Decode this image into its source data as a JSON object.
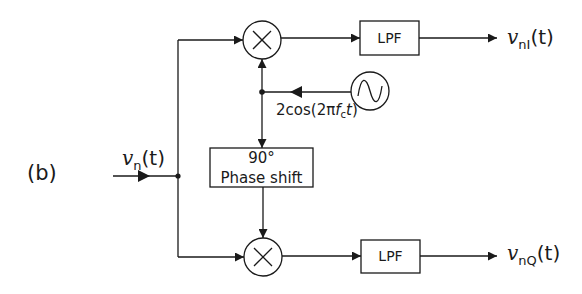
{
  "figure": {
    "panel_label": "(b)",
    "input": {
      "symbol": "v",
      "subscript": "n",
      "arg": "(t)"
    },
    "outputs": {
      "in_phase": {
        "symbol": "v",
        "subscript": "nI",
        "arg": "(t)"
      },
      "quadrature": {
        "symbol": "v",
        "subscript": "nQ",
        "arg": "(t)"
      }
    },
    "blocks": {
      "top_mixer": {
        "glyph": "×",
        "icon": "multiplier-icon"
      },
      "bottom_mixer": {
        "glyph": "×",
        "icon": "multiplier-icon"
      },
      "top_lpf": {
        "label": "LPF"
      },
      "bottom_lpf": {
        "label": "LPF"
      },
      "phase_shift": {
        "line1": "90°",
        "line2": "Phase shift"
      },
      "oscillator": {
        "icon": "sine-wave-icon"
      }
    },
    "oscillator_signal": {
      "prefix": "2cos(2π",
      "f": "f",
      "sub": "c",
      "t": "t",
      "suffix": ")"
    },
    "colors": {
      "stroke": "#1a1a1a",
      "background": "#ffffff"
    }
  }
}
